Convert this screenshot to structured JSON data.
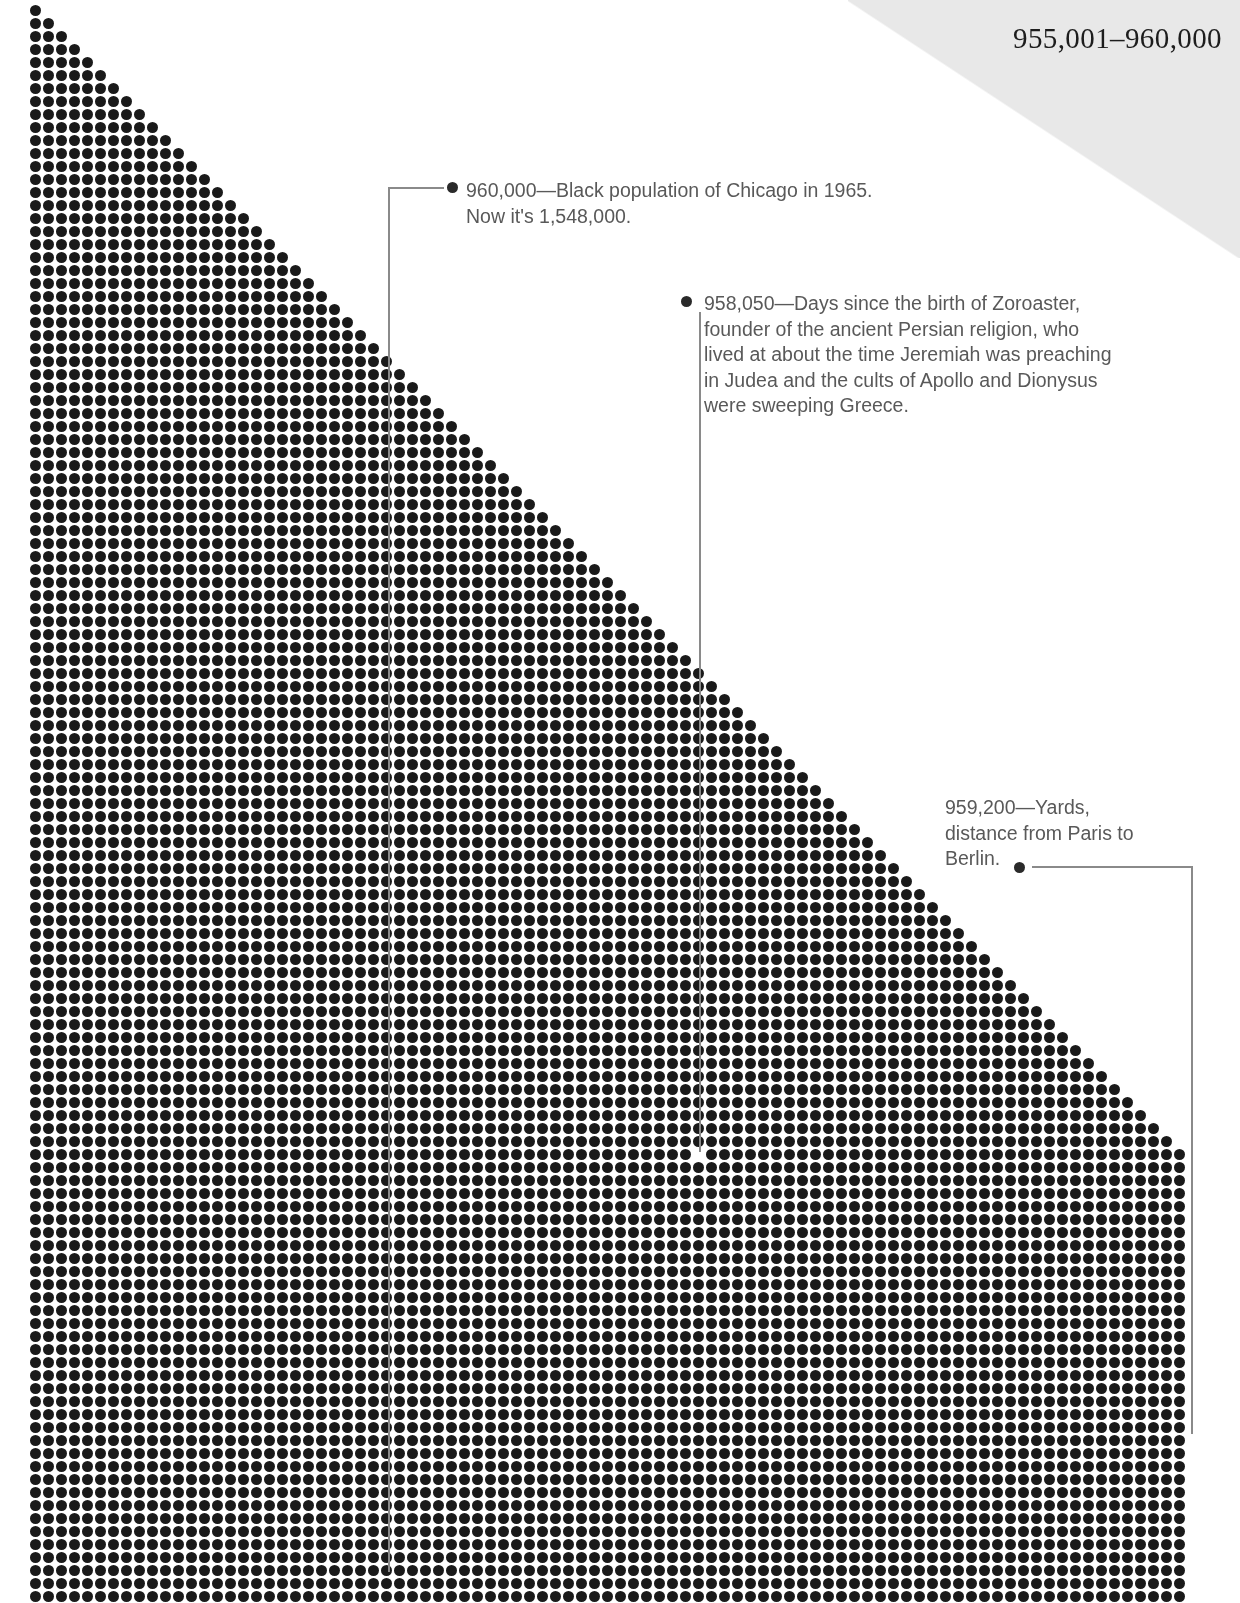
{
  "header": {
    "range_label": "955,001–960,000"
  },
  "annotations": [
    {
      "id": "ann-1",
      "number": "960,000",
      "text": "960,000—Black population of Chicago in 1965.\nNow it's 1,548,000."
    },
    {
      "id": "ann-2",
      "number": "958,050",
      "text": "958,050—Days since the birth of Zoroaster,\nfounder of the ancient Persian religion, who\nlived at about the time Jeremiah was preaching\nin Judea and the cults of Apollo and Dionysus\nwere sweeping Greece."
    },
    {
      "id": "ann-3",
      "number": "959,200",
      "text": "959,200—Yards,\ndistance from Paris to\nBerlin."
    }
  ],
  "chart_data": {
    "type": "scatter",
    "title": "955,001–960,000",
    "xlabel": "",
    "ylabel": "",
    "dot_grid": {
      "origin_x": 30,
      "origin_y": 5,
      "spacing_x": 13.0,
      "spacing_y": 13.0,
      "dot_diameter": 11,
      "dot_color": "#1a1a1a",
      "rows": 123,
      "max_columns": 89,
      "row_rule": "row i (0-based) has min(i+1, max_columns) dots",
      "missing_dots": [
        {
          "row": 88,
          "col": 51
        }
      ]
    },
    "annotation_points": [
      {
        "label": "960,000",
        "x": 447,
        "y": 182
      },
      {
        "label": "958,050",
        "x": 681,
        "y": 296
      },
      {
        "label": "959,200",
        "x": 1014,
        "y": 862
      }
    ],
    "colors": {
      "dot": "#1a1a1a",
      "text": "#595959",
      "leader_line": "#8a8a8a",
      "wedge": "#e8e8e8",
      "background": "#ffffff"
    }
  }
}
